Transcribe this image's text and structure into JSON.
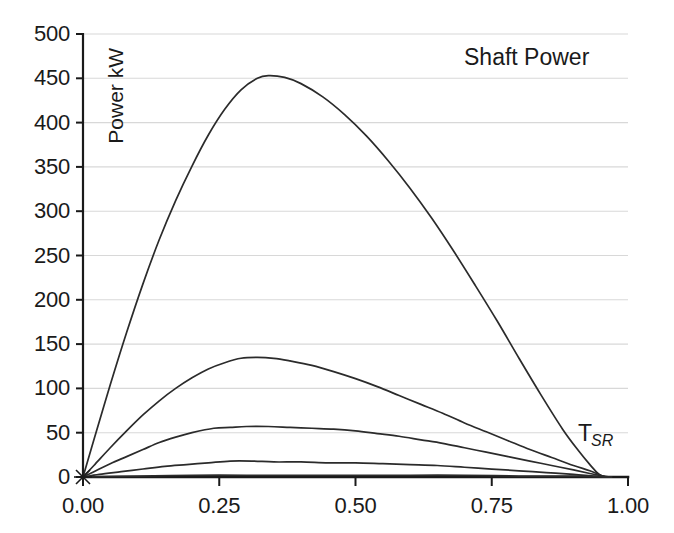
{
  "chart_data": {
    "type": "line",
    "title": "Shaft Power",
    "xlabel": "T_SR",
    "xlabel_base": "T",
    "xlabel_sub": "SR",
    "ylabel": "Power kW",
    "xlim": [
      0.0,
      1.0
    ],
    "ylim": [
      0,
      500
    ],
    "grid": true,
    "legend_position": "none",
    "x_ticks": [
      0.0,
      0.25,
      0.5,
      0.75,
      1.0
    ],
    "x_tick_labels": [
      "0.00",
      "0.25",
      "0.50",
      "0.75",
      "1.00"
    ],
    "y_ticks": [
      0,
      50,
      100,
      150,
      200,
      250,
      300,
      350,
      400,
      450,
      500
    ],
    "y_tick_labels": [
      "0",
      "50",
      "100",
      "150",
      "200",
      "250",
      "300",
      "350",
      "400",
      "450",
      "500"
    ],
    "line_color": "#2b2b2b",
    "grid_color": "#d8d8d8",
    "axis_color": "#1a1a1a",
    "series": [
      {
        "name": "curve-1",
        "x": [
          0.0,
          0.02,
          0.05,
          0.08,
          0.11,
          0.14,
          0.17,
          0.2,
          0.23,
          0.26,
          0.29,
          0.32,
          0.34,
          0.37,
          0.4,
          0.44,
          0.48,
          0.52,
          0.56,
          0.6,
          0.64,
          0.68,
          0.72,
          0.76,
          0.8,
          0.84,
          0.88,
          0.91,
          0.93,
          0.945,
          0.955
        ],
        "y": [
          0,
          42,
          104,
          163,
          218,
          268,
          312,
          351,
          386,
          415,
          437,
          450,
          453,
          451,
          444,
          429,
          409,
          385,
          357,
          326,
          292,
          255,
          216,
          176,
          134,
          93,
          54,
          29,
          14,
          4,
          0
        ]
      },
      {
        "name": "curve-2",
        "x": [
          0.0,
          0.02,
          0.05,
          0.08,
          0.11,
          0.14,
          0.17,
          0.2,
          0.23,
          0.26,
          0.29,
          0.32,
          0.35,
          0.38,
          0.42,
          0.46,
          0.5,
          0.54,
          0.58,
          0.62,
          0.66,
          0.7,
          0.74,
          0.78,
          0.82,
          0.86,
          0.9,
          0.93,
          0.95,
          0.96
        ],
        "y": [
          0,
          13,
          33,
          52,
          70,
          86,
          100,
          112,
          122,
          129,
          134,
          135,
          134,
          131,
          126,
          119,
          111,
          102,
          92,
          82,
          72,
          61,
          51,
          41,
          31,
          22,
          13,
          7,
          2,
          0
        ]
      },
      {
        "name": "curve-3",
        "x": [
          0.0,
          0.02,
          0.05,
          0.08,
          0.11,
          0.14,
          0.17,
          0.2,
          0.24,
          0.27,
          0.3,
          0.34,
          0.38,
          0.42,
          0.46,
          0.5,
          0.54,
          0.58,
          0.62,
          0.66,
          0.7,
          0.74,
          0.78,
          0.82,
          0.86,
          0.9,
          0.93,
          0.955,
          0.965
        ],
        "y": [
          0,
          6,
          15,
          23,
          31,
          39,
          45,
          50,
          55,
          56,
          57,
          57,
          56,
          55,
          54,
          52,
          49,
          46,
          42,
          38,
          33,
          28,
          23,
          18,
          13,
          8,
          4,
          1,
          0
        ]
      },
      {
        "name": "curve-4",
        "x": [
          0.0,
          0.03,
          0.07,
          0.11,
          0.15,
          0.19,
          0.23,
          0.27,
          0.31,
          0.35,
          0.4,
          0.45,
          0.5,
          0.55,
          0.6,
          0.65,
          0.7,
          0.75,
          0.8,
          0.85,
          0.9,
          0.94,
          0.97
        ],
        "y": [
          0,
          3,
          6,
          9,
          12,
          14,
          16,
          18,
          18,
          17,
          17,
          16,
          16,
          15,
          14,
          13,
          11,
          9,
          7,
          5,
          3,
          1,
          0
        ]
      },
      {
        "name": "curve-5",
        "x": [
          0.0,
          0.1,
          0.2,
          0.3,
          0.4,
          0.5,
          0.6,
          0.7,
          0.8,
          0.9,
          0.97
        ],
        "y": [
          0,
          1,
          2,
          2,
          2,
          2,
          2,
          2,
          1,
          1,
          0
        ]
      }
    ]
  }
}
